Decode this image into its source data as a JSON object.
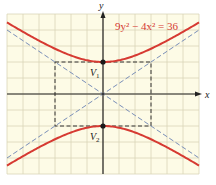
{
  "figure": {
    "equation": "9y² − 4x² = 36",
    "x_axis_label": "x",
    "y_axis_label": "y",
    "vertices": [
      {
        "label": "V",
        "subscript": "1",
        "x": 0,
        "y": 2
      },
      {
        "label": "V",
        "subscript": "2",
        "x": 0,
        "y": -2
      }
    ],
    "caption": ""
  },
  "chart_data": {
    "type": "line",
    "title": "9y² − 4x² = 36",
    "xlabel": "x",
    "ylabel": "y",
    "xlim": [
      -6,
      6
    ],
    "ylim": [
      -5,
      5
    ],
    "grid": true,
    "grid_step": 1,
    "series": [
      {
        "name": "hyperbola upper branch",
        "equation": "y = 2*sqrt(1 + x^2/9)",
        "color": "#d63a32"
      },
      {
        "name": "hyperbola lower branch",
        "equation": "y = -2*sqrt(1 + x^2/9)",
        "color": "#d63a32"
      },
      {
        "name": "asymptote 1",
        "equation": "y = (2/3)x",
        "style": "dashed",
        "color": "#7a8fb8"
      },
      {
        "name": "asymptote 2",
        "equation": "y = -(2/3)x",
        "style": "dashed",
        "color": "#7a8fb8"
      }
    ],
    "fundamental_rectangle": {
      "x": [
        -3,
        3
      ],
      "y": [
        -2,
        2
      ],
      "style": "dashed"
    },
    "annotations": [
      {
        "text": "V1",
        "x": 0,
        "y": 2
      },
      {
        "text": "V2",
        "x": 0,
        "y": -2
      }
    ],
    "colors": {
      "background": "#fdfbe6",
      "grid": "#d9d6b8",
      "curve": "#d63a32",
      "asymptote": "#7a8fb8",
      "axes": "#222222"
    }
  }
}
